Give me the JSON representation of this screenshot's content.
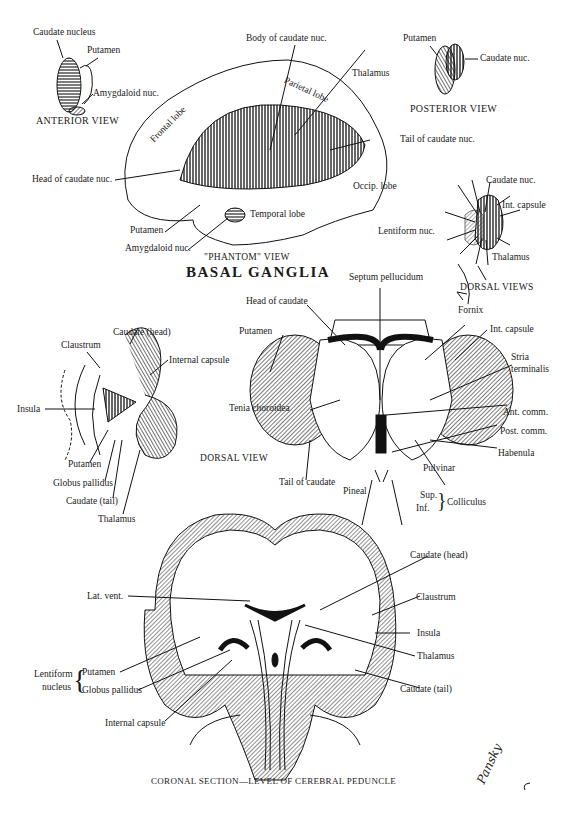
{
  "figure": {
    "title": "BASAL GANGLIA",
    "signature": "Pansky"
  },
  "anterior_view": {
    "caption": "ANTERIOR VIEW",
    "labels": [
      "Caudate nucleus",
      "Putamen",
      "Amygdaloid nuc."
    ]
  },
  "posterior_view": {
    "caption": "POSTERIOR VIEW",
    "labels": [
      "Putamen",
      "Caudate nuc."
    ]
  },
  "phantom_view": {
    "caption": "\"PHANTOM\" VIEW",
    "labels": {
      "body_caudate": "Body of caudate nuc.",
      "thalamus": "Thalamus",
      "parietal": "Parietal lobe",
      "frontal": "Frontal lobe",
      "tail_caudate": "Tail of caudate nuc.",
      "head_caudate": "Head of caudate nuc.",
      "occipital": "Occip. lobe",
      "temporal": "Temporal lobe",
      "putamen": "Putamen",
      "amygdaloid": "Amygdaloid nuc."
    }
  },
  "small_dorsal_view": {
    "labels": {
      "caudate": "Caudate nuc.",
      "int_capsule": "Int. capsule",
      "lentiform": "Lentiform  nuc.",
      "thalamus": "Thalamus"
    }
  },
  "dorsal_views": {
    "caption": "DORSAL VIEWS",
    "labels": {
      "septum": "Septum pellucidum",
      "head_caudate": "Head of caudate",
      "fornix": "Fornix",
      "putamen": "Putamen",
      "int_capsule": "Int. capsule",
      "stria_1": "Stria",
      "stria_2": "terminalis",
      "tenia": "Tenia choroidea",
      "ant_comm": "Ant. comm.",
      "post_comm": "Post. comm.",
      "habenula": "Habenula",
      "pulvinar": "Pulvinar",
      "tail_caudate": "Tail of caudate",
      "pineal": "Pineal",
      "sup": "Sup.",
      "inf": "Inf.",
      "colliculus": "Colliculus"
    }
  },
  "left_dorsal_view": {
    "caption": "DORSAL VIEW",
    "labels": {
      "caudate_head": "Caudate (head)",
      "claustrum": "Claustrum",
      "internal_capsule": "Internal capsule",
      "insula": "Insula",
      "putamen": "Putamen",
      "globus_pallidus": "Globus pallidus",
      "caudate_tail": "Caudate (tail)",
      "thalamus": "Thalamus"
    }
  },
  "coronal_section": {
    "caption": "CORONAL SECTION—LEVEL OF CEREBRAL PEDUNCLE",
    "labels": {
      "lat_vent": "Lat. vent.",
      "caudate_head": "Caudate (head)",
      "claustrum": "Claustrum",
      "insula": "Insula",
      "thalamus": "Thalamus",
      "caudate_tail": "Caudate (tail)",
      "lentiform_1": "Lentiform",
      "lentiform_2": "nucleus",
      "putamen": "Putamen",
      "globus_pallidus": "Globus pallidus",
      "internal_capsule": "Internal capsule"
    }
  }
}
